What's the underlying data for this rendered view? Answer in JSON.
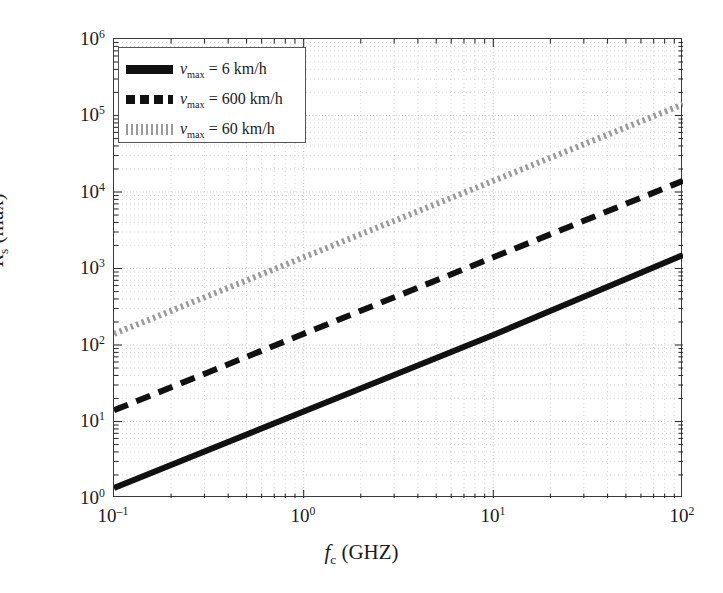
{
  "figure": {
    "background": "#ffffff",
    "frame_color": "#3a3a3a"
  },
  "axes": {
    "x": {
      "label_prefix": "f",
      "label_sub": "c",
      "label_suffix": " (GHZ)",
      "label_full": "f_c (GHZ)",
      "scale": "log",
      "min": 0.1,
      "max": 100,
      "ticks": [
        {
          "value": 0.1,
          "mantissa": "10",
          "exponent": "−1"
        },
        {
          "value": 1,
          "mantissa": "10",
          "exponent": "0"
        },
        {
          "value": 10,
          "mantissa": "10",
          "exponent": "1"
        },
        {
          "value": 100,
          "mantissa": "10",
          "exponent": "2"
        }
      ]
    },
    "y": {
      "label_prefix": "R",
      "label_sub": "s",
      "label_suffix": " (max)",
      "label_full": "R_s (max)",
      "scale": "log",
      "min": 1,
      "max": 1000000,
      "ticks": [
        {
          "value": 1000000,
          "mantissa": "10",
          "exponent": "6"
        },
        {
          "value": 100000,
          "mantissa": "10",
          "exponent": "5"
        },
        {
          "value": 10000,
          "mantissa": "10",
          "exponent": "4"
        },
        {
          "value": 1000,
          "mantissa": "10",
          "exponent": "3"
        },
        {
          "value": 100,
          "mantissa": "10",
          "exponent": "2"
        },
        {
          "value": 10,
          "mantissa": "10",
          "exponent": "1"
        },
        {
          "value": 1,
          "mantissa": "10",
          "exponent": "0"
        }
      ]
    }
  },
  "legend": {
    "position": "top-left",
    "border_color": "#555555",
    "background": "#ffffff",
    "entries": [
      {
        "label": "ν_max = 6 km/h",
        "prefix": "ν",
        "sub": "max",
        "suffix": " = 6 km/h",
        "style": "solid",
        "color": "#111111"
      },
      {
        "label": "ν_max = 600 km/h",
        "prefix": "ν",
        "sub": "max",
        "suffix": " = 600 km/h",
        "style": "dashed",
        "color": "#111111"
      },
      {
        "label": "ν_max = 60 km/h",
        "prefix": "ν",
        "sub": "max",
        "suffix": " = 60 km/h",
        "style": "dotted",
        "color": "#9a9a9a"
      }
    ]
  },
  "chart_data": {
    "type": "line",
    "title": "",
    "xlabel": "f_c (GHZ)",
    "ylabel": "R_s (max)",
    "xscale": "log",
    "yscale": "log",
    "xlim": [
      0.1,
      100
    ],
    "ylim": [
      1,
      1000000
    ],
    "grid": true,
    "grid_minor": true,
    "grid_style": "dotted",
    "grid_color": "#bdbdbd",
    "legend_position": "upper left",
    "x": [
      0.1,
      1,
      10,
      100
    ],
    "series": [
      {
        "name": "ν_max = 6 km/h",
        "style": "solid",
        "color": "#111111",
        "linewidth": 6,
        "values": [
          1.35,
          13.5,
          135,
          1500
        ]
      },
      {
        "name": "ν_max = 600 km/h",
        "style": "dashed",
        "color": "#111111",
        "linewidth": 6,
        "values": [
          14,
          140,
          1400,
          14000
        ]
      },
      {
        "name": "ν_max = 60 km/h",
        "style": "dotted",
        "color": "#9a9a9a",
        "linewidth": 6,
        "values": [
          140,
          1400,
          14000,
          140000
        ]
      }
    ]
  }
}
